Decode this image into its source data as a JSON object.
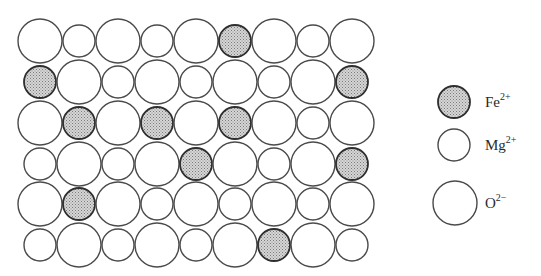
{
  "figure": {
    "grid": {
      "columns": 9,
      "rows": 6,
      "x_centers": [
        40,
        79,
        118,
        157,
        196,
        235,
        274,
        313,
        352
      ],
      "y_centers": [
        41,
        82,
        123,
        164,
        204,
        245
      ],
      "cells": [
        [
          "O",
          "Mg",
          "O",
          "Mg",
          "O",
          "Fe",
          "O",
          "Mg",
          "O"
        ],
        [
          "Fe",
          "O",
          "Mg",
          "O",
          "Mg",
          "O",
          "Mg",
          "O",
          "Fe"
        ],
        [
          "O",
          "Fe",
          "O",
          "Fe",
          "O",
          "Fe",
          "O",
          "Mg",
          "O"
        ],
        [
          "Mg",
          "O",
          "Mg",
          "O",
          "Fe",
          "O",
          "Mg",
          "O",
          "Fe"
        ],
        [
          "O",
          "Fe",
          "O",
          "Mg",
          "O",
          "Mg",
          "O",
          "Mg",
          "O"
        ],
        [
          "Mg",
          "O",
          "Mg",
          "O",
          "Mg",
          "O",
          "Fe",
          "O",
          "Mg"
        ]
      ]
    },
    "species": {
      "Fe": {
        "radius": 16,
        "fill": "#c4c4c4",
        "pattern": "stipple",
        "stroke": "#2e2e2e"
      },
      "Mg": {
        "radius": 16,
        "fill": "#ffffff",
        "pattern": "none",
        "stroke": "#4a4a4a"
      },
      "O": {
        "radius": 22,
        "fill": "#ffffff",
        "pattern": "none",
        "stroke": "#4a4a4a"
      }
    }
  },
  "legend": {
    "items": [
      {
        "species": "Fe",
        "symbol": "Fe",
        "charge": "2+",
        "cx": 454,
        "cy": 102,
        "label_x": 485,
        "label_y": 95
      },
      {
        "species": "Mg",
        "symbol": "Mg",
        "charge": "2+",
        "cx": 454,
        "cy": 145,
        "label_x": 485,
        "label_y": 138
      },
      {
        "species": "O",
        "symbol": "O",
        "charge": "2−",
        "cx": 455,
        "cy": 203,
        "label_x": 485,
        "label_y": 196
      }
    ]
  }
}
